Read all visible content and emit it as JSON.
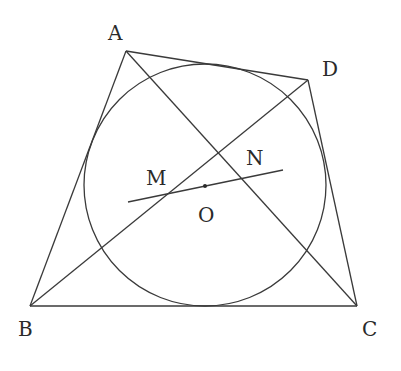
{
  "figure": {
    "type": "geometry",
    "colors": {
      "stroke": "#3a3a3a",
      "text": "#2a2a2a",
      "background": "#ffffff"
    },
    "points": {
      "A": {
        "label": "A",
        "x": 126,
        "y": 51,
        "label_x": 108,
        "label_y": 40
      },
      "B": {
        "label": "B",
        "x": 30,
        "y": 306,
        "label_x": 18,
        "label_y": 336
      },
      "C": {
        "label": "C",
        "x": 357,
        "y": 306,
        "label_x": 362,
        "label_y": 336
      },
      "D": {
        "label": "D",
        "x": 308,
        "y": 80,
        "label_x": 322,
        "label_y": 76
      },
      "M": {
        "label": "M",
        "x": 168,
        "y": 193,
        "label_x": 146,
        "label_y": 185
      },
      "N": {
        "label": "N",
        "x": 242,
        "y": 178,
        "label_x": 246,
        "label_y": 165
      },
      "O": {
        "label": "O",
        "x": 205,
        "y": 186,
        "label_x": 198,
        "label_y": 222
      }
    },
    "circle": {
      "name": "incircle",
      "cx": 205,
      "cy": 185,
      "r": 121
    },
    "segments": [
      {
        "name": "side-AB",
        "from": "A",
        "to": "B"
      },
      {
        "name": "side-BC",
        "from": "B",
        "to": "C"
      },
      {
        "name": "side-CD",
        "from": "C",
        "to": "D"
      },
      {
        "name": "side-DA",
        "from": "D",
        "to": "A"
      },
      {
        "name": "diagonal-AC",
        "from": "A",
        "to": "C"
      },
      {
        "name": "diagonal-BD",
        "from": "B",
        "to": "D"
      }
    ],
    "line_MN": {
      "x1": 128,
      "y1": 202,
      "x2": 283,
      "y2": 170
    },
    "center_dot": {
      "cx": 205,
      "cy": 186,
      "r": 2
    }
  }
}
